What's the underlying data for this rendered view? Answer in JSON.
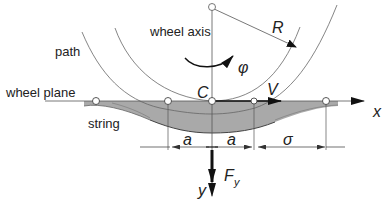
{
  "diagram": {
    "labels": {
      "wheel_axis": "wheel axis",
      "path": "path",
      "wheel_plane": "wheel plane",
      "string": "string"
    },
    "symbols": {
      "radius": "R",
      "rotation": "φ",
      "contact_center": "C",
      "velocity": "V",
      "x_axis": "x",
      "y_axis": "y",
      "force": "F",
      "force_subscript": "y",
      "half_contact_left": "a",
      "half_contact_right": "a",
      "relaxation_length": "σ"
    },
    "colors": {
      "line": "#555555",
      "fill": "#a9a9a9",
      "arrow": "#111111",
      "background": "#ffffff"
    }
  }
}
